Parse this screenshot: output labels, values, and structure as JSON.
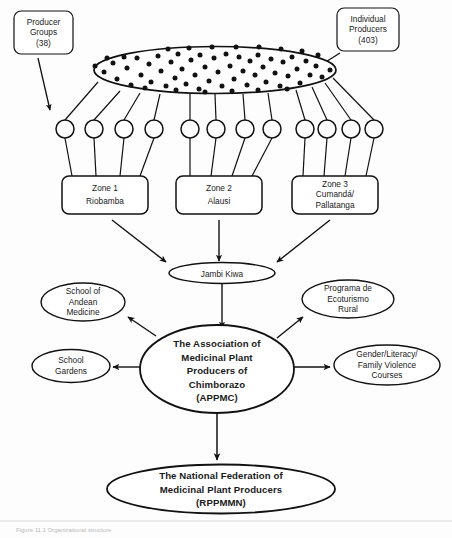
{
  "figure": {
    "caption": "Figure 11.1  Organizational structure"
  },
  "callouts": [
    {
      "id": "producer-groups",
      "lines": [
        "Producer",
        "Groups",
        "(38)"
      ],
      "count": "38",
      "label": "Producer Groups"
    },
    {
      "id": "individual-producers",
      "lines": [
        "Individual",
        "Producers",
        "(403)"
      ],
      "count": "403",
      "label": "Individual Producers"
    }
  ],
  "pool": {
    "name": "individual-producers-pool",
    "dot_count": 68
  },
  "group_nodes": {
    "name": "producer-group-circle",
    "total": 12,
    "per_zone": 4
  },
  "zones": [
    {
      "id": "zone-1",
      "lines": [
        "Zone 1",
        "Riobamba"
      ],
      "number": "Zone 1",
      "place": "Riobamba"
    },
    {
      "id": "zone-2",
      "lines": [
        "Zone 2",
        "Alausi"
      ],
      "number": "Zone 2",
      "place": "Alausi"
    },
    {
      "id": "zone-3",
      "lines": [
        "Zone 3",
        "Cumandá/",
        "Pallatanga"
      ],
      "number": "Zone 3",
      "place": "Cumandá/ Pallatanga"
    }
  ],
  "hub": {
    "id": "jambi-kiwa",
    "lines": [
      "Jambi Kiwa"
    ],
    "label": "Jambi Kiwa"
  },
  "center": {
    "id": "appmc",
    "lines": [
      "The Association of",
      "Medicinal Plant",
      "Producers of",
      "Chimborazo",
      "(APPMC)"
    ],
    "label": "The Association of Medicinal Plant Producers of Chimborazo (APPMC)",
    "acronym": "APPMC"
  },
  "programs": [
    {
      "id": "school-andean-medicine",
      "lines": [
        "School of",
        "Andean",
        "Medicine"
      ],
      "label": "School of Andean Medicine"
    },
    {
      "id": "school-gardens",
      "lines": [
        "School",
        "Gardens"
      ],
      "label": "School Gardens"
    },
    {
      "id": "programa-ecoturismo-rural",
      "lines": [
        "Programa de",
        "Ecoturismo",
        "Rural"
      ],
      "label": "Programa de Ecoturismo Rural"
    },
    {
      "id": "gender-literacy-courses",
      "lines": [
        "Gender/Literacy/",
        "Family Violence",
        "Courses"
      ],
      "label": "Gender/Literacy/Family Violence Courses"
    }
  ],
  "bottom": {
    "id": "rppmmn",
    "lines": [
      "The National Federation of",
      "Medicinal Plant Producers",
      "(RPPMMN)"
    ],
    "label": "The National Federation of Medicinal Plant Producers (RPPMMN)",
    "acronym": "RPPMMN"
  },
  "colors": {
    "stroke": "#111111",
    "fill": "#ffffff",
    "text": "#1a1a1a",
    "background": "#fdfdfd",
    "caption": "#b9b9b9"
  }
}
